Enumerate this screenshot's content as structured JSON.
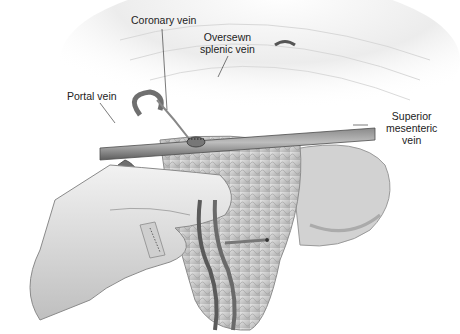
{
  "figure": {
    "type": "surgical anatomical illustration",
    "labels": {
      "coronary_vein": "Coronary vein",
      "oversewn_splenic_vein_line1": "Oversewn",
      "oversewn_splenic_vein_line2": "splenic vein",
      "portal_vein": "Portal vein",
      "superior_mesenteric_vein_line1": "Superior",
      "superior_mesenteric_vein_line2": "mesenteric",
      "superior_mesenteric_vein_line3": "vein"
    },
    "colors": {
      "background": "#ffffff",
      "tissue_light": "#e6e6e6",
      "tissue_mid": "#b5b5b5",
      "vessel_dark": "#555555",
      "text": "#222222"
    }
  }
}
